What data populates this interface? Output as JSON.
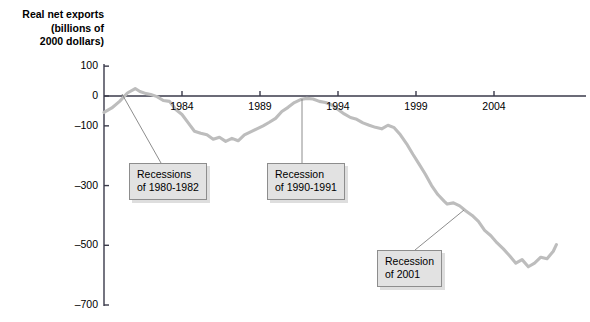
{
  "chart_data": {
    "type": "line",
    "title_line1": "Real net exports",
    "title_line2": "(billions of",
    "title_line3": "2000 dollars)",
    "xlabel": "",
    "ylabel": "Real net exports (billions of 2000 dollars)",
    "ylim": [
      -700,
      100
    ],
    "xlim": [
      1979,
      2008
    ],
    "grid": false,
    "legend": null,
    "line_color": "#bdbdbd",
    "axis_color": "#3a3a4a",
    "y_ticks": [
      100,
      0,
      -100,
      -300,
      -500,
      -700
    ],
    "y_tick_labels": [
      "100",
      "0",
      "–100",
      "–300",
      "–500",
      "–700"
    ],
    "x_ticks": [
      1984,
      1989,
      1994,
      1999,
      2004
    ],
    "x_tick_labels": [
      "1984",
      "1989",
      "1994",
      "1999",
      "2004"
    ],
    "series": [
      {
        "name": "Real net exports",
        "x": [
          1979.0,
          1979.5,
          1980.0,
          1980.5,
          1981.0,
          1981.3,
          1981.7,
          1982.0,
          1982.4,
          1982.8,
          1983.2,
          1983.6,
          1984.0,
          1984.4,
          1984.8,
          1985.2,
          1985.6,
          1986.0,
          1986.4,
          1986.8,
          1987.2,
          1987.6,
          1988.0,
          1988.4,
          1988.8,
          1989.2,
          1989.6,
          1990.0,
          1990.4,
          1990.8,
          1991.2,
          1991.6,
          1992.0,
          1992.4,
          1992.8,
          1993.2,
          1993.6,
          1994.0,
          1994.4,
          1994.8,
          1995.2,
          1995.6,
          1996.0,
          1996.4,
          1996.8,
          1997.2,
          1997.6,
          1998.0,
          1998.4,
          1998.8,
          1999.2,
          1999.6,
          2000.0,
          2000.4,
          2000.8,
          2001.0,
          2001.4,
          2001.8,
          2002.2,
          2002.6,
          2003.0,
          2003.4,
          2003.8,
          2004.2,
          2004.6,
          2005.0,
          2005.4,
          2005.8,
          2006.2,
          2006.6,
          2007.0,
          2007.4,
          2007.8,
          2008.0
        ],
        "values": [
          -55,
          -40,
          -18,
          10,
          25,
          15,
          8,
          5,
          -2,
          -15,
          -18,
          -45,
          -62,
          -90,
          -118,
          -125,
          -130,
          -145,
          -138,
          -152,
          -142,
          -150,
          -130,
          -120,
          -110,
          -100,
          -88,
          -75,
          -52,
          -38,
          -22,
          -12,
          -8,
          -10,
          -18,
          -22,
          -30,
          -45,
          -60,
          -72,
          -78,
          -90,
          -98,
          -105,
          -110,
          -98,
          -106,
          -130,
          -160,
          -195,
          -228,
          -262,
          -300,
          -330,
          -352,
          -362,
          -358,
          -368,
          -385,
          -400,
          -420,
          -450,
          -468,
          -492,
          -512,
          -535,
          -560,
          -548,
          -572,
          -560,
          -540,
          -545,
          -520,
          -498
        ]
      }
    ],
    "annotations": [
      {
        "id": "recessions-1980-1982",
        "line1": "Recessions",
        "line2": "of 1980-1982",
        "box_x": 129,
        "box_y": 163,
        "leader_from": [
          122,
          94
        ],
        "leader_to": [
          161,
          163
        ]
      },
      {
        "id": "recession-1990-1991",
        "line1": "Recession",
        "line2": "of 1990-1991",
        "box_x": 267,
        "box_y": 163,
        "leader_from": [
          302,
          99
        ],
        "leader_to": [
          302,
          163
        ]
      },
      {
        "id": "recession-2001",
        "line1": "Recession",
        "line2": "of 2001",
        "box_x": 377,
        "box_y": 250,
        "leader_from": [
          464,
          210
        ],
        "leader_to": [
          415,
          250
        ]
      }
    ]
  }
}
